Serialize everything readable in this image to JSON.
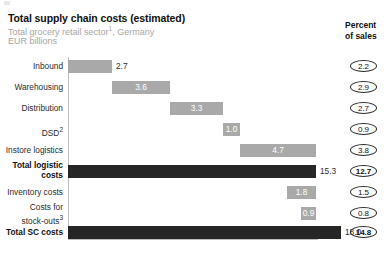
{
  "header": {
    "title": "Total supply chain costs (estimated)",
    "subtitle_line1_main": "Total grocery retail sector",
    "subtitle_line1_sup": "1",
    "subtitle_line1_tail": ", Germany",
    "subtitle_line2": "EUR billions",
    "percent_head_line1": "Percent",
    "percent_head_line2": "of sales"
  },
  "colors": {
    "bar_light": "#a9a9a9",
    "bar_dark": "#262626",
    "axis": "#bdbdbd",
    "subtitle": "#a6a6a6",
    "text": "#2b2b2b"
  },
  "chart_data": {
    "type": "bar",
    "subtype": "waterfall",
    "title": "Total supply chain costs (estimated)",
    "subtitle": "Total grocery retail sector1, Germany",
    "xlabel": "",
    "ylabel": "EUR billions",
    "unit": "EUR billions",
    "grid": false,
    "legend": false,
    "xlim": [
      0,
      18.0
    ],
    "categories": [
      "Inbound",
      "Warehousing",
      "Distribution",
      "DSD2",
      "Instore logistics",
      "Total logistic costs",
      "Inventory costs",
      "Costs for stock-outs3",
      "Total SC costs"
    ],
    "values": [
      2.7,
      3.6,
      3.3,
      1.0,
      4.7,
      15.3,
      1.8,
      0.9,
      18.0
    ],
    "starts": [
      0.0,
      2.7,
      6.3,
      9.6,
      10.6,
      0.0,
      15.3,
      17.1,
      0.0
    ],
    "kinds": [
      "step",
      "step",
      "step",
      "step",
      "step",
      "total",
      "step",
      "step",
      "total"
    ],
    "secondary_axis_label": "Percent of sales",
    "secondary_values": [
      2.2,
      2.9,
      2.7,
      0.9,
      3.8,
      12.7,
      1.5,
      0.8,
      14.8
    ]
  },
  "rows": [
    {
      "label_lines": [
        "Inbound"
      ],
      "value": "2.7",
      "percent": "2.2",
      "bold": false,
      "dark": false,
      "value_inside": false,
      "left": 68,
      "width": 44,
      "top": 60
    },
    {
      "label_lines": [
        "Warehousing"
      ],
      "value": "3.6",
      "percent": "2.9",
      "bold": false,
      "dark": false,
      "value_inside": true,
      "left": 112,
      "width": 58,
      "top": 81
    },
    {
      "label_lines": [
        "Distribution"
      ],
      "value": "3.3",
      "percent": "2.7",
      "bold": false,
      "dark": false,
      "value_inside": true,
      "left": 170,
      "width": 53,
      "top": 102
    },
    {
      "label_lines": [
        "DSD2"
      ],
      "value": "1.0",
      "percent": "0.9",
      "bold": false,
      "dark": false,
      "value_inside": true,
      "left": 223,
      "width": 17,
      "top": 123
    },
    {
      "label_lines": [
        "Instore logistics"
      ],
      "value": "4.7",
      "percent": "3.8",
      "bold": false,
      "dark": false,
      "value_inside": true,
      "left": 240,
      "width": 76,
      "top": 144
    },
    {
      "label_lines": [
        "Total logistic",
        "costs"
      ],
      "value": "15.3",
      "percent": "12.7",
      "bold": true,
      "dark": true,
      "value_inside": false,
      "left": 68,
      "width": 248,
      "top": 165
    },
    {
      "label_lines": [
        "Inventory costs"
      ],
      "value": "1.8",
      "percent": "1.5",
      "bold": false,
      "dark": false,
      "value_inside": true,
      "left": 287,
      "width": 29,
      "top": 186
    },
    {
      "label_lines": [
        "Costs for",
        "stock-outs3"
      ],
      "value": "0.9",
      "percent": "0.8",
      "bold": false,
      "dark": false,
      "value_inside": true,
      "left": 301,
      "width": 15,
      "top": 207
    },
    {
      "label_lines": [
        "Total SC costs"
      ],
      "value": "18.0",
      "percent": "14.8",
      "bold": true,
      "dark": true,
      "value_inside": false,
      "left": 68,
      "width": 273,
      "top": 226
    }
  ],
  "footnote": ""
}
